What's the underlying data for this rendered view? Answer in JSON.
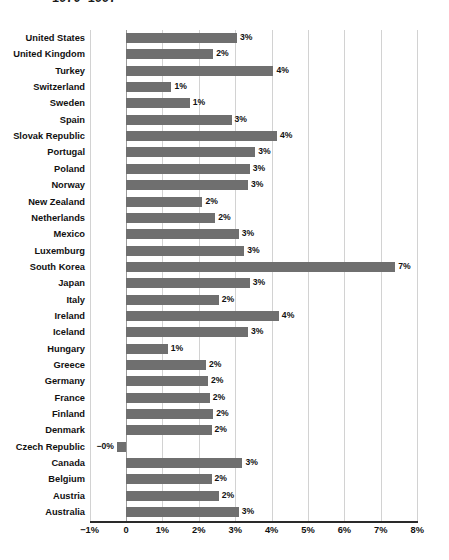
{
  "chart_data": {
    "type": "bar",
    "orientation": "horizontal",
    "title": "1970–1997",
    "xlabel": "",
    "ylabel": "",
    "xlim": [
      -1,
      8
    ],
    "xticks": [
      -1,
      0,
      1,
      2,
      3,
      4,
      5,
      6,
      7,
      8
    ],
    "xtick_labels": [
      "−1%",
      "0",
      "1%",
      "2%",
      "3%",
      "4%",
      "5%",
      "6%",
      "7%",
      "8%"
    ],
    "grid": true,
    "legend": "none",
    "bar_color": "#6f6f6f",
    "categories": [
      "United States",
      "United Kingdom",
      "Turkey",
      "Switzerland",
      "Sweden",
      "Spain",
      "Slovak Republic",
      "Portugal",
      "Poland",
      "Norway",
      "New Zealand",
      "Netherlands",
      "Mexico",
      "Luxemburg",
      "South Korea",
      "Japan",
      "Italy",
      "Ireland",
      "Iceland",
      "Hungary",
      "Greece",
      "Germany",
      "France",
      "Finland",
      "Denmark",
      "Czech Republic",
      "Canada",
      "Belgium",
      "Austria",
      "Australia"
    ],
    "values": [
      3.05,
      2.4,
      4.05,
      1.25,
      1.75,
      2.9,
      4.15,
      3.55,
      3.4,
      3.35,
      2.1,
      2.45,
      3.1,
      3.25,
      7.4,
      3.4,
      2.55,
      4.2,
      3.35,
      1.15,
      2.2,
      2.25,
      2.3,
      2.4,
      2.35,
      -0.25,
      3.2,
      2.35,
      2.55,
      3.1
    ],
    "data_labels": [
      "3%",
      "2%",
      "4%",
      "1%",
      "1%",
      "3%",
      "4%",
      "3%",
      "3%",
      "3%",
      "2%",
      "2%",
      "3%",
      "3%",
      "7%",
      "3%",
      "2%",
      "4%",
      "3%",
      "1%",
      "2%",
      "2%",
      "2%",
      "2%",
      "2%",
      "−0%",
      "3%",
      "2%",
      "2%",
      "3%"
    ]
  }
}
